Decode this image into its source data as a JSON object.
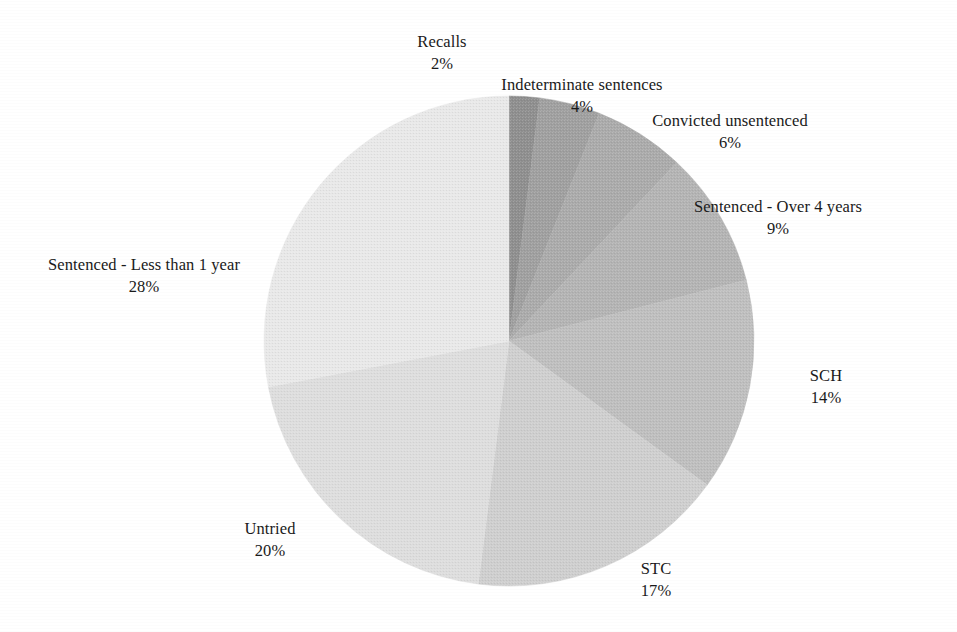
{
  "chart_data": {
    "type": "pie",
    "title": "",
    "subtitle": "",
    "xlabel": "",
    "ylabel": "",
    "legend_position": "none",
    "grid": false,
    "value_unit": "%",
    "start_angle_deg": 0,
    "direction": "clockwise",
    "categories": [
      "Recalls",
      "Indeterminate sentences",
      "Convicted unsentenced",
      "Sentenced - Over 4 years",
      "SCH",
      "STC",
      "Untried",
      "Sentenced - Less than 1 year"
    ],
    "values": [
      2,
      4,
      6,
      9,
      14,
      17,
      20,
      28
    ],
    "value_labels": [
      "2%",
      "4%",
      "6%",
      "9%",
      "14%",
      "17%",
      "20%",
      "28%"
    ],
    "colors": [
      "#8f8f8f",
      "#a0a0a0",
      "#ababab",
      "#b4b4b4",
      "#bfbfbf",
      "#cfcfcf",
      "#dedede",
      "#e9e9e9"
    ],
    "slices": [
      {
        "label": "Recalls",
        "value": 2,
        "value_label": "2%",
        "color": "#8f8f8f"
      },
      {
        "label": "Indeterminate sentences",
        "value": 4,
        "value_label": "4%",
        "color": "#a0a0a0"
      },
      {
        "label": "Convicted unsentenced",
        "value": 6,
        "value_label": "6%",
        "color": "#ababab"
      },
      {
        "label": "Sentenced - Over 4 years",
        "value": 9,
        "value_label": "9%",
        "color": "#b4b4b4"
      },
      {
        "label": "SCH",
        "value": 14,
        "value_label": "14%",
        "color": "#bfbfbf"
      },
      {
        "label": "STC",
        "value": 17,
        "value_label": "17%",
        "color": "#cfcfcf"
      },
      {
        "label": "Untried",
        "value": 20,
        "value_label": "20%",
        "color": "#dedede"
      },
      {
        "label": "Sentenced - Less than 1 year",
        "value": 28,
        "value_label": "28%",
        "color": "#e9e9e9"
      }
    ],
    "total": 100
  },
  "geometry": {
    "center_x": 509,
    "center_y": 341,
    "radius": 245
  }
}
